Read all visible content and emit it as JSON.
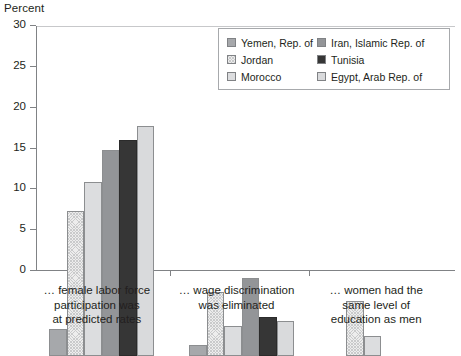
{
  "chart_data": {
    "type": "bar",
    "title": "",
    "ylabel": "Percent",
    "xlabel": "",
    "ylim": [
      0,
      30
    ],
    "yticks": [
      0,
      5,
      10,
      15,
      20,
      25,
      30
    ],
    "grid": false,
    "legend_position": "top-right",
    "categories": [
      "… female labor force participation was at predicted rates",
      "… wage discrimination was eliminated",
      "… women had the same level of education as men"
    ],
    "category_lines": [
      [
        "… female labor force",
        "participation was",
        "at predicted rates"
      ],
      [
        "… wage discrimination",
        "was eliminated"
      ],
      [
        "… women had the",
        "same level of",
        "education as men"
      ]
    ],
    "series": [
      {
        "name": "Yemen, Rep. of",
        "color": "#a6a8ab",
        "fill": "solid-medium-gray",
        "values": [
          3.3,
          1.3,
          null
        ]
      },
      {
        "name": "Jordan",
        "color": "#ededed",
        "fill": "cross-hatch-light",
        "values": [
          17.8,
          7.8,
          6.7
        ]
      },
      {
        "name": "Morocco",
        "color": "#dcdddf",
        "fill": "solid-light-gray",
        "values": [
          21.3,
          3.7,
          2.4
        ]
      },
      {
        "name": "Iran, Islamic Rep. of",
        "color": "#939598",
        "fill": "solid-gray",
        "values": [
          25.2,
          9.6,
          null
        ]
      },
      {
        "name": "Tunisia",
        "color": "#363636",
        "fill": "solid-dark",
        "values": [
          26.4,
          4.8,
          null
        ]
      },
      {
        "name": "Egypt, Arab Rep. of",
        "color": "#d9dadc",
        "fill": "solid-light",
        "values": [
          28.2,
          4.3,
          null
        ]
      }
    ]
  },
  "legend": {
    "column1": [
      "Yemen, Rep. of",
      "Jordan",
      "Morocco"
    ],
    "column2": [
      "Iran, Islamic Rep. of",
      "Tunisia",
      "Egypt, Arab Rep. of"
    ]
  },
  "axis": {
    "y_label": "Percent",
    "y_tick_labels": [
      "30",
      "25",
      "20",
      "15",
      "10",
      "5",
      "0"
    ]
  }
}
